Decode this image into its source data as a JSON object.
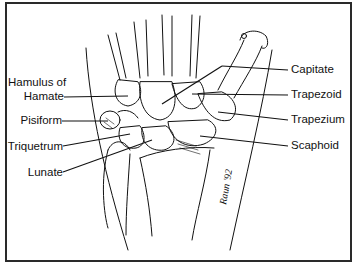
{
  "figure": {
    "labels_left": [
      {
        "id": "hamulus",
        "line1": "Hamulus of",
        "line2": "Hamate"
      },
      {
        "id": "pisiform",
        "text": "Pisiform"
      },
      {
        "id": "triquetrum",
        "text": "Triquetrum"
      },
      {
        "id": "lunate",
        "text": "Lunate"
      }
    ],
    "labels_right": [
      {
        "id": "capitate",
        "text": "Capitate"
      },
      {
        "id": "trapezoid",
        "text": "Trapezoid"
      },
      {
        "id": "trapezium",
        "text": "Trapezium"
      },
      {
        "id": "scaphoid",
        "text": "Scaphoid"
      }
    ],
    "signature": "Raun '92",
    "colors": {
      "ink": "#111111",
      "border": "#2a2a2a",
      "background": "#ffffff"
    }
  }
}
